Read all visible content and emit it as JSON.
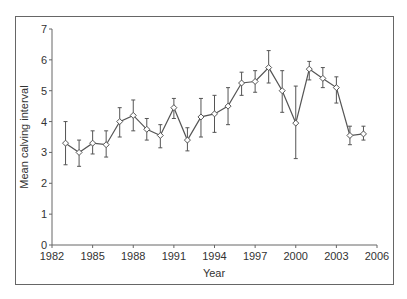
{
  "chart_data": {
    "type": "line",
    "title": "",
    "xlabel": "Year",
    "ylabel": "Mean calving interval",
    "xlim": [
      1982,
      2006
    ],
    "ylim": [
      0,
      7
    ],
    "x_ticks": [
      1982,
      1985,
      1988,
      1991,
      1994,
      1997,
      2000,
      2003,
      2006
    ],
    "y_ticks": [
      0,
      1,
      2,
      3,
      4,
      5,
      6,
      7
    ],
    "grid": false,
    "legend": null,
    "markers": "open-diamond",
    "error_bars": true,
    "series": [
      {
        "name": "Mean calving interval",
        "x": [
          1983,
          1984,
          1985,
          1986,
          1987,
          1988,
          1989,
          1990,
          1991,
          1992,
          1993,
          1994,
          1995,
          1996,
          1997,
          1998,
          1999,
          2000,
          2001,
          2002,
          2003,
          2004,
          2005
        ],
        "values": [
          3.3,
          3.0,
          3.3,
          3.25,
          4.0,
          4.2,
          3.75,
          3.55,
          4.45,
          3.4,
          4.15,
          4.25,
          4.5,
          5.25,
          5.3,
          5.75,
          5.0,
          3.95,
          5.7,
          5.4,
          5.1,
          3.55,
          3.6
        ],
        "err_low": [
          2.6,
          2.55,
          2.95,
          2.85,
          3.5,
          3.7,
          3.4,
          3.15,
          4.1,
          3.05,
          3.5,
          3.65,
          3.9,
          4.85,
          4.95,
          5.25,
          4.3,
          2.8,
          5.35,
          5.1,
          4.6,
          3.25,
          3.4
        ],
        "err_high": [
          4.0,
          3.4,
          3.7,
          3.7,
          4.45,
          4.7,
          4.1,
          3.9,
          4.75,
          3.8,
          4.75,
          4.85,
          5.1,
          5.6,
          5.65,
          6.3,
          5.65,
          5.15,
          5.95,
          5.75,
          5.45,
          3.85,
          3.85
        ]
      }
    ]
  },
  "colors": {
    "line": "#555555",
    "frame": "#666666",
    "text": "#333333",
    "marker_fill": "#ffffff"
  }
}
